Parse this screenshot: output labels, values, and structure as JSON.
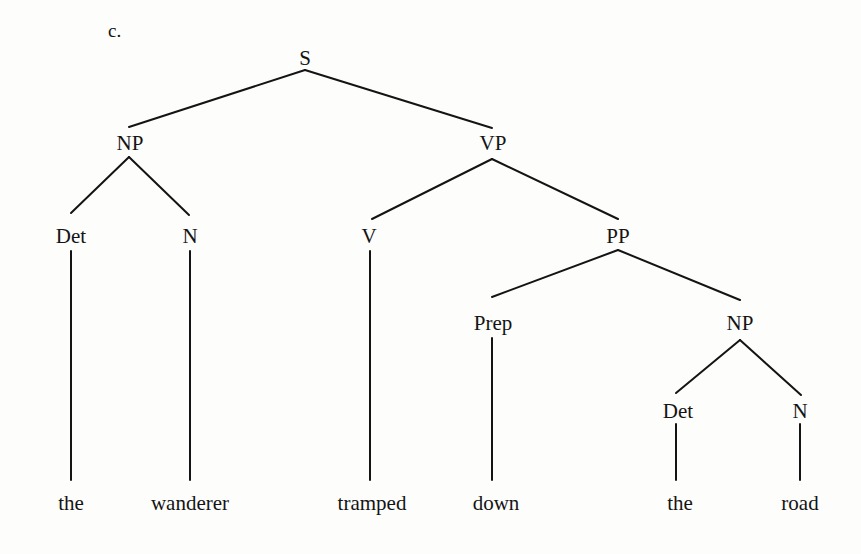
{
  "caption": "c.",
  "nodes": {
    "S": {
      "label": "S",
      "x": 305,
      "y": 58
    },
    "NP1": {
      "label": "NP",
      "x": 130,
      "y": 143
    },
    "VP": {
      "label": "VP",
      "x": 493,
      "y": 143
    },
    "Det1": {
      "label": "Det",
      "x": 71,
      "y": 236
    },
    "N1": {
      "label": "N",
      "x": 190,
      "y": 236
    },
    "V": {
      "label": "V",
      "x": 369,
      "y": 236
    },
    "PP": {
      "label": "PP",
      "x": 618,
      "y": 236
    },
    "Prep": {
      "label": "Prep",
      "x": 493,
      "y": 323
    },
    "NP2": {
      "label": "NP",
      "x": 740,
      "y": 323
    },
    "Det2": {
      "label": "Det",
      "x": 678,
      "y": 411
    },
    "N2": {
      "label": "N",
      "x": 800,
      "y": 411
    }
  },
  "words": [
    {
      "text": "the",
      "x": 71,
      "y": 503
    },
    {
      "text": "wanderer",
      "x": 190,
      "y": 503
    },
    {
      "text": "tramped",
      "x": 372,
      "y": 503
    },
    {
      "text": "down",
      "x": 496,
      "y": 503
    },
    {
      "text": "the",
      "x": 680,
      "y": 503
    },
    {
      "text": "road",
      "x": 800,
      "y": 503
    }
  ],
  "edges": [
    {
      "from": "S",
      "to": "NP1",
      "x1": 305,
      "y1": 70,
      "x2": 129,
      "y2": 127
    },
    {
      "from": "S",
      "to": "VP",
      "x1": 305,
      "y1": 70,
      "x2": 492,
      "y2": 128
    },
    {
      "from": "NP1",
      "to": "Det1",
      "x1": 129,
      "y1": 157,
      "x2": 71,
      "y2": 213
    },
    {
      "from": "NP1",
      "to": "N1",
      "x1": 129,
      "y1": 157,
      "x2": 189,
      "y2": 215
    },
    {
      "from": "VP",
      "to": "V",
      "x1": 492,
      "y1": 159,
      "x2": 372,
      "y2": 219
    },
    {
      "from": "VP",
      "to": "PP",
      "x1": 492,
      "y1": 159,
      "x2": 618,
      "y2": 219
    },
    {
      "from": "PP",
      "to": "Prep",
      "x1": 618,
      "y1": 250,
      "x2": 492,
      "y2": 297
    },
    {
      "from": "PP",
      "to": "NP2",
      "x1": 618,
      "y1": 250,
      "x2": 740,
      "y2": 300
    },
    {
      "from": "NP2",
      "to": "Det2",
      "x1": 740,
      "y1": 340,
      "x2": 676,
      "y2": 393
    },
    {
      "from": "NP2",
      "to": "N2",
      "x1": 740,
      "y1": 340,
      "x2": 801,
      "y2": 395
    },
    {
      "from": "Det1",
      "to": "the",
      "x1": 71,
      "y1": 251,
      "x2": 71,
      "y2": 480
    },
    {
      "from": "N1",
      "to": "wanderer",
      "x1": 190,
      "y1": 251,
      "x2": 190,
      "y2": 480
    },
    {
      "from": "V",
      "to": "tramped",
      "x1": 370,
      "y1": 251,
      "x2": 370,
      "y2": 480
    },
    {
      "from": "Prep",
      "to": "down",
      "x1": 492,
      "y1": 338,
      "x2": 492,
      "y2": 480
    },
    {
      "from": "Det2",
      "to": "the",
      "x1": 676,
      "y1": 424,
      "x2": 676,
      "y2": 480
    },
    {
      "from": "N2",
      "to": "road",
      "x1": 800,
      "y1": 424,
      "x2": 800,
      "y2": 480
    }
  ]
}
